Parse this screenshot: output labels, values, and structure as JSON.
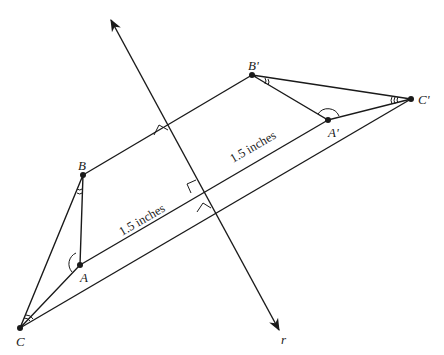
{
  "figure": {
    "line_label": "r",
    "points": {
      "A": {
        "label": "A",
        "x": 80,
        "y": 265
      },
      "B": {
        "label": "B",
        "x": 83,
        "y": 175
      },
      "C": {
        "label": "C",
        "x": 20,
        "y": 328
      },
      "A_prime": {
        "label": "A'",
        "x": 328,
        "y": 120
      },
      "B_prime": {
        "label": "B'",
        "x": 252,
        "y": 75
      },
      "C_prime": {
        "label": "C'",
        "x": 411,
        "y": 99
      }
    },
    "measurements": [
      {
        "text": "1.5 inches",
        "segment": "A to line r"
      },
      {
        "text": "1.5 inches",
        "segment": "line r to A'"
      }
    ],
    "markings": {
      "angle_A": "single arc",
      "angle_B": "double tick arc",
      "angle_C": "triple tick arc",
      "right_angles": 3
    },
    "colors": {
      "stroke": "#1a1a1a",
      "background": "#ffffff"
    }
  }
}
